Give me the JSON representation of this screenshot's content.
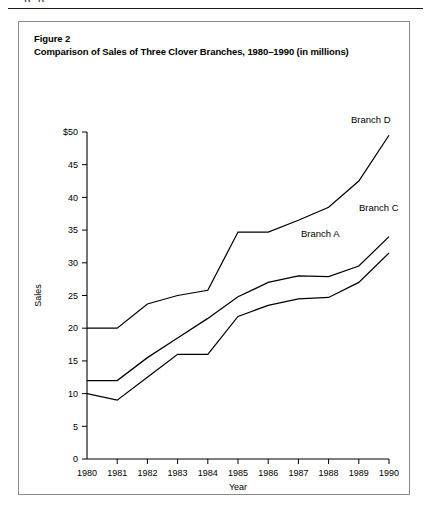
{
  "page": {
    "bleed_text": "p                p"
  },
  "figure": {
    "caption_line1": "Figure 2",
    "caption_line2": "Comparison of Sales of Three Clover Branches, 1980–1990 (in millions)"
  },
  "chart_data": {
    "type": "line",
    "title": "Comparison of Sales of Three Clover Branches, 1980–1990 (in millions)",
    "xlabel": "Year",
    "ylabel": "Sales",
    "categories": [
      1980,
      1981,
      1982,
      1983,
      1984,
      1985,
      1986,
      1987,
      1988,
      1989,
      1990
    ],
    "x_tick_labels": [
      "1980",
      "1981",
      "1982",
      "1983",
      "1984",
      "1985",
      "1986",
      "1987",
      "1988",
      "1989",
      "1990"
    ],
    "y_tick_labels": [
      "0",
      "5",
      "10",
      "15",
      "20",
      "25",
      "30",
      "35",
      "40",
      "45",
      "$50"
    ],
    "y_ticks": [
      0,
      5,
      10,
      15,
      20,
      25,
      30,
      35,
      40,
      45,
      50
    ],
    "ylim": [
      0,
      50
    ],
    "xlim": [
      1980,
      1990
    ],
    "grid": false,
    "legend_position": "inline-right",
    "line_color": "#000000",
    "series": [
      {
        "name": "Branch D",
        "label": "Branch D",
        "values": [
          20,
          20,
          23.7,
          25.0,
          25.8,
          34.7,
          34.7,
          36.5,
          38.5,
          42.5,
          49.5
        ]
      },
      {
        "name": "Branch C",
        "label": "Branch C",
        "values": [
          12,
          12,
          15.5,
          18.5,
          21.5,
          24.8,
          27.0,
          28.0,
          27.9,
          29.5,
          34.0
        ]
      },
      {
        "name": "Branch A",
        "label": "Branch A",
        "values": [
          10,
          9,
          12.5,
          16.0,
          16.0,
          21.8,
          23.5,
          24.5,
          24.7,
          27.0,
          31.5
        ]
      }
    ]
  }
}
